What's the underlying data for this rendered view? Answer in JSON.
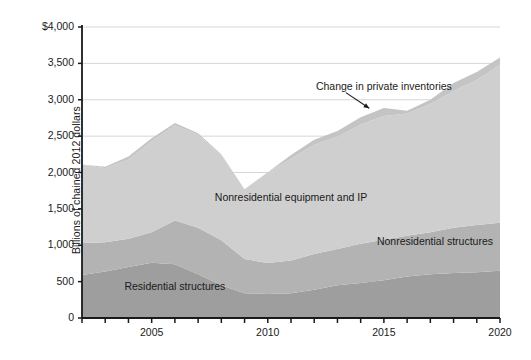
{
  "chart_data": {
    "type": "area",
    "title": "",
    "subtitle": "",
    "xlabel": "",
    "ylabel": "Billions of chained 2012 dollars",
    "xlim": [
      2002,
      2020
    ],
    "ylim": [
      0,
      4000
    ],
    "grid": true,
    "legend_position": "inline-annotations",
    "stacked": true,
    "x": [
      2002,
      2003,
      2004,
      2005,
      2006,
      2007,
      2008,
      2009,
      2010,
      2011,
      2012,
      2013,
      2014,
      2015,
      2016,
      2017,
      2018,
      2019,
      2020
    ],
    "ytick_labels": [
      "$4,000",
      "3,500",
      "3,000",
      "2,500",
      "2,000",
      "1,500",
      "1,000",
      "500",
      "0"
    ],
    "ytick_values": [
      4000,
      3500,
      3000,
      2500,
      2000,
      1500,
      1000,
      500,
      0
    ],
    "xtick_values": [
      2002,
      2003,
      2004,
      2005,
      2006,
      2007,
      2008,
      2009,
      2010,
      2011,
      2012,
      2013,
      2014,
      2015,
      2016,
      2017,
      2018,
      2019,
      2020
    ],
    "xtick_labels": [
      "",
      "",
      "",
      "2005",
      "",
      "",
      "",
      "",
      "2010",
      "",
      "",
      "",
      "",
      "2015",
      "",
      "",
      "",
      "",
      "2020"
    ],
    "series": [
      {
        "name": "Residential structures",
        "color": "#9e9e9e",
        "values": [
          590,
          640,
          700,
          760,
          740,
          600,
          450,
          340,
          330,
          340,
          390,
          450,
          480,
          520,
          570,
          600,
          620,
          630,
          650
        ]
      },
      {
        "name": "Nonresidential structures",
        "color": "#b3b3b3",
        "values": [
          440,
          400,
          390,
          420,
          600,
          640,
          620,
          470,
          425,
          450,
          490,
          500,
          540,
          555,
          560,
          580,
          620,
          650,
          660
        ]
      },
      {
        "name": "Nonresidential equipment and IP",
        "color": "#cfcfcf",
        "values": [
          1080,
          1020,
          1090,
          1250,
          1310,
          1280,
          1170,
          960,
          1250,
          1400,
          1500,
          1540,
          1640,
          1700,
          1680,
          1760,
          1880,
          1990,
          2170
        ]
      },
      {
        "name": "Change in private inventories",
        "color": "#c4c4c4",
        "values": [
          0,
          20,
          40,
          40,
          30,
          20,
          10,
          0,
          0,
          50,
          70,
          80,
          100,
          110,
          40,
          60,
          110,
          110,
          100
        ]
      }
    ],
    "annotations": [
      {
        "name": "change-in-private-inventories",
        "text": "Change in private inventories",
        "x": 2015.0,
        "y": 3180,
        "arrow_to_x": 2014.8,
        "arrow_to_y": 3130
      },
      {
        "name": "nonresidential-equipment-and-ip",
        "text": "Nonresidential equipment and IP",
        "x": 2011.0,
        "y": 1650
      },
      {
        "name": "nonresidential-structures",
        "text": "Nonresidential structures",
        "x": 2017.2,
        "y": 1050
      },
      {
        "name": "residential-structures",
        "text": "Residential structures",
        "x": 2006.0,
        "y": 420
      }
    ],
    "axis_color": "#1a1a1a",
    "gridline_color": "#d6d6d6",
    "background_color": "#ffffff"
  }
}
